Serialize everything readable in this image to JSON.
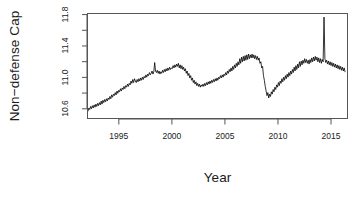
{
  "chart_data": {
    "type": "line",
    "title": "",
    "xlabel": "Year",
    "ylabel": "Non−defense Cap",
    "xlim": [
      1992.0,
      2016.6
    ],
    "ylim": [
      10.47,
      11.82
    ],
    "grid": false,
    "legend": null,
    "x_ticks": [
      1995,
      2000,
      2005,
      2010,
      2015
    ],
    "x_tick_labels": [
      "1995",
      "2000",
      "2005",
      "2010",
      "2015"
    ],
    "x_minor_ticks": [],
    "y_ticks": [
      10.6,
      11.0,
      11.4,
      11.8
    ],
    "y_tick_labels": [
      "10.6",
      "11.0",
      "11.4",
      "11.8"
    ],
    "y_minor_ticks": [
      10.8,
      11.2,
      11.6
    ],
    "line_color": "#000000",
    "line_width": 0.8,
    "series": [
      {
        "name": "Non-defense Cap",
        "x": [
          1992.0,
          1992.083,
          1992.167,
          1992.25,
          1992.333,
          1992.417,
          1992.5,
          1992.583,
          1992.667,
          1992.75,
          1992.833,
          1992.917,
          1993.0,
          1993.083,
          1993.167,
          1993.25,
          1993.333,
          1993.417,
          1993.5,
          1993.583,
          1993.667,
          1993.75,
          1993.833,
          1993.917,
          1994.0,
          1994.083,
          1994.167,
          1994.25,
          1994.333,
          1994.417,
          1994.5,
          1994.583,
          1994.667,
          1994.75,
          1994.833,
          1994.917,
          1995.0,
          1995.083,
          1995.167,
          1995.25,
          1995.333,
          1995.417,
          1995.5,
          1995.583,
          1995.667,
          1995.75,
          1995.833,
          1995.917,
          1996.0,
          1996.083,
          1996.167,
          1996.25,
          1996.333,
          1996.417,
          1996.5,
          1996.583,
          1996.667,
          1996.75,
          1996.833,
          1996.917,
          1997.0,
          1997.083,
          1997.167,
          1997.25,
          1997.333,
          1997.417,
          1997.5,
          1997.583,
          1997.667,
          1997.75,
          1997.833,
          1997.917,
          1998.0,
          1998.083,
          1998.167,
          1998.25,
          1998.333,
          1998.417,
          1998.5,
          1998.583,
          1998.667,
          1998.75,
          1998.833,
          1998.917,
          1999.0,
          1999.083,
          1999.167,
          1999.25,
          1999.333,
          1999.417,
          1999.5,
          1999.583,
          1999.667,
          1999.75,
          1999.833,
          1999.917,
          2000.0,
          2000.083,
          2000.167,
          2000.25,
          2000.333,
          2000.417,
          2000.5,
          2000.583,
          2000.667,
          2000.75,
          2000.833,
          2000.917,
          2001.0,
          2001.083,
          2001.167,
          2001.25,
          2001.333,
          2001.417,
          2001.5,
          2001.583,
          2001.667,
          2001.75,
          2001.833,
          2001.917,
          2002.0,
          2002.083,
          2002.167,
          2002.25,
          2002.333,
          2002.417,
          2002.5,
          2002.583,
          2002.667,
          2002.75,
          2002.833,
          2002.917,
          2003.0,
          2003.083,
          2003.167,
          2003.25,
          2003.333,
          2003.417,
          2003.5,
          2003.583,
          2003.667,
          2003.75,
          2003.833,
          2003.917,
          2004.0,
          2004.083,
          2004.167,
          2004.25,
          2004.333,
          2004.417,
          2004.5,
          2004.583,
          2004.667,
          2004.75,
          2004.833,
          2004.917,
          2005.0,
          2005.083,
          2005.167,
          2005.25,
          2005.333,
          2005.417,
          2005.5,
          2005.583,
          2005.667,
          2005.75,
          2005.833,
          2005.917,
          2006.0,
          2006.083,
          2006.167,
          2006.25,
          2006.333,
          2006.417,
          2006.5,
          2006.583,
          2006.667,
          2006.75,
          2006.833,
          2006.917,
          2007.0,
          2007.083,
          2007.167,
          2007.25,
          2007.333,
          2007.417,
          2007.5,
          2007.583,
          2007.667,
          2007.75,
          2007.833,
          2007.917,
          2008.0,
          2008.083,
          2008.167,
          2008.25,
          2008.333,
          2008.417,
          2008.5,
          2008.583,
          2008.667,
          2008.75,
          2008.833,
          2008.917,
          2009.0,
          2009.083,
          2009.167,
          2009.25,
          2009.333,
          2009.417,
          2009.5,
          2009.583,
          2009.667,
          2009.75,
          2009.833,
          2009.917,
          2010.0,
          2010.083,
          2010.167,
          2010.25,
          2010.333,
          2010.417,
          2010.5,
          2010.583,
          2010.667,
          2010.75,
          2010.833,
          2010.917,
          2011.0,
          2011.083,
          2011.167,
          2011.25,
          2011.333,
          2011.417,
          2011.5,
          2011.583,
          2011.667,
          2011.75,
          2011.833,
          2011.917,
          2012.0,
          2012.083,
          2012.167,
          2012.25,
          2012.333,
          2012.417,
          2012.5,
          2012.583,
          2012.667,
          2012.75,
          2012.833,
          2012.917,
          2013.0,
          2013.083,
          2013.167,
          2013.25,
          2013.333,
          2013.417,
          2013.5,
          2013.583,
          2013.667,
          2013.75,
          2013.833,
          2013.917,
          2014.0,
          2014.083,
          2014.167,
          2014.25,
          2014.333,
          2014.417,
          2014.5,
          2014.583,
          2014.667,
          2014.75,
          2014.833,
          2014.917,
          2015.0,
          2015.083,
          2015.167,
          2015.25,
          2015.333,
          2015.417,
          2015.5,
          2015.583,
          2015.667,
          2015.75,
          2015.833,
          2015.917,
          2016.0,
          2016.083,
          2016.167,
          2016.25,
          2016.333,
          2016.417
        ],
        "y": [
          10.56,
          10.6,
          10.58,
          10.62,
          10.59,
          10.63,
          10.6,
          10.64,
          10.61,
          10.65,
          10.62,
          10.66,
          10.63,
          10.67,
          10.64,
          10.69,
          10.65,
          10.7,
          10.67,
          10.71,
          10.68,
          10.72,
          10.69,
          10.73,
          10.71,
          10.75,
          10.72,
          10.77,
          10.74,
          10.78,
          10.76,
          10.8,
          10.77,
          10.82,
          10.79,
          10.83,
          10.81,
          10.85,
          10.82,
          10.86,
          10.84,
          10.88,
          10.85,
          10.89,
          10.87,
          10.91,
          10.88,
          10.92,
          10.9,
          10.95,
          10.92,
          10.97,
          10.93,
          10.98,
          10.95,
          10.93,
          10.97,
          10.94,
          10.98,
          10.95,
          10.99,
          10.96,
          11.0,
          10.97,
          11.01,
          10.99,
          11.03,
          11.0,
          11.04,
          11.02,
          11.06,
          11.03,
          11.05,
          11.08,
          11.04,
          11.07,
          11.19,
          11.08,
          11.06,
          11.09,
          11.05,
          11.08,
          11.04,
          11.07,
          11.05,
          11.09,
          11.06,
          11.1,
          11.07,
          11.11,
          11.08,
          11.12,
          11.09,
          11.13,
          11.1,
          11.12,
          11.11,
          11.15,
          11.12,
          11.16,
          11.13,
          11.17,
          11.14,
          11.18,
          11.12,
          11.16,
          11.11,
          11.15,
          11.1,
          11.13,
          11.08,
          11.11,
          11.05,
          11.08,
          11.02,
          11.05,
          10.99,
          11.02,
          10.96,
          10.99,
          10.93,
          10.96,
          10.91,
          10.94,
          10.89,
          10.92,
          10.88,
          10.91,
          10.87,
          10.9,
          10.88,
          10.91,
          10.88,
          10.92,
          10.89,
          10.93,
          10.9,
          10.94,
          10.91,
          10.95,
          10.92,
          10.96,
          10.93,
          10.97,
          10.94,
          10.98,
          10.95,
          10.99,
          10.96,
          11.0,
          10.98,
          11.02,
          10.99,
          11.03,
          11.0,
          11.04,
          11.02,
          11.06,
          11.03,
          11.08,
          11.05,
          11.1,
          11.07,
          11.12,
          11.08,
          11.14,
          11.1,
          11.16,
          11.12,
          11.18,
          11.14,
          11.2,
          11.16,
          11.24,
          11.18,
          11.26,
          11.2,
          11.27,
          11.21,
          11.28,
          11.22,
          11.29,
          11.23,
          11.3,
          11.24,
          11.29,
          11.25,
          11.3,
          11.25,
          11.29,
          11.24,
          11.28,
          11.23,
          11.27,
          11.22,
          11.25,
          11.18,
          11.2,
          11.12,
          11.14,
          11.02,
          10.96,
          10.88,
          10.82,
          10.76,
          10.8,
          10.73,
          10.78,
          10.75,
          10.81,
          10.78,
          10.84,
          10.81,
          10.87,
          10.84,
          10.9,
          10.87,
          10.93,
          10.89,
          10.95,
          10.92,
          10.98,
          10.94,
          11.0,
          10.96,
          11.02,
          10.98,
          11.04,
          11.0,
          11.06,
          11.02,
          11.08,
          11.04,
          11.1,
          11.06,
          11.13,
          11.08,
          11.15,
          11.1,
          11.17,
          11.12,
          11.2,
          11.14,
          11.21,
          11.16,
          11.22,
          11.18,
          11.24,
          11.19,
          11.23,
          11.18,
          11.22,
          11.17,
          11.23,
          11.19,
          11.25,
          11.2,
          11.26,
          11.21,
          11.27,
          11.22,
          11.26,
          11.2,
          11.25,
          11.19,
          11.24,
          11.18,
          11.23,
          11.2,
          11.78,
          11.24,
          11.19,
          11.22,
          11.17,
          11.21,
          11.16,
          11.2,
          11.15,
          11.19,
          11.14,
          11.18,
          11.13,
          11.17,
          11.12,
          11.16,
          11.11,
          11.15,
          11.1,
          11.14,
          11.09,
          11.13,
          11.08,
          11.12,
          11.07
        ]
      }
    ]
  },
  "axis": {
    "y_title": "Non−defense Cap",
    "x_title": "Year"
  }
}
